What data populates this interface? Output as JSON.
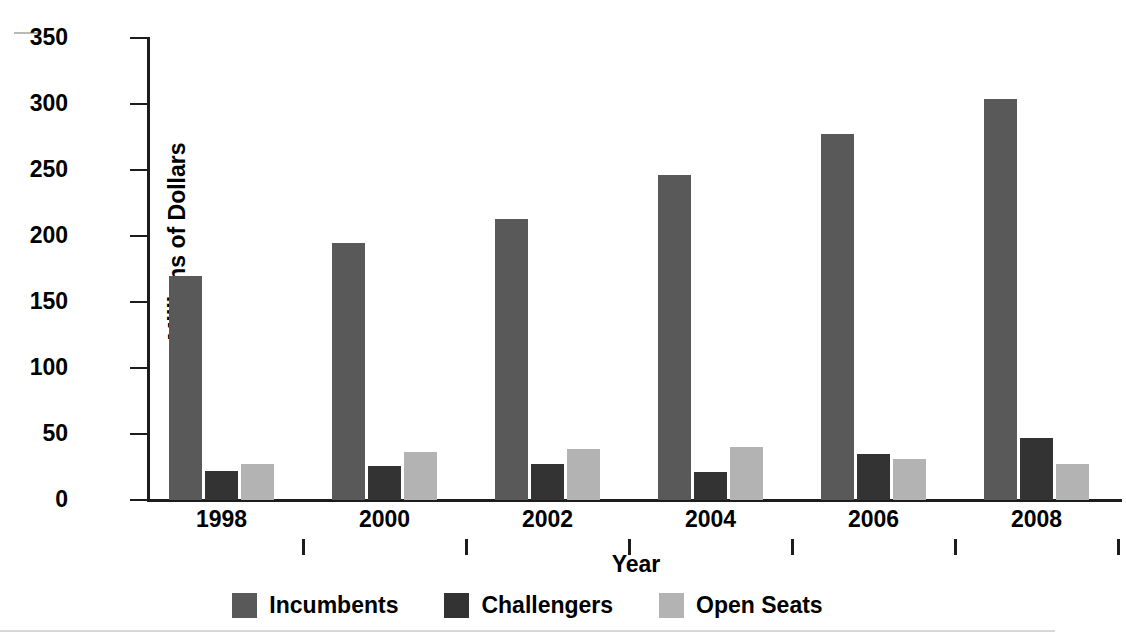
{
  "figure": {
    "background": "#ffffff",
    "axis_color": "#1c1c1c"
  },
  "chart_data": {
    "type": "bar",
    "title": "",
    "xlabel": "Year",
    "ylabel": "Millions of Dollars",
    "categories": [
      "1998",
      "2000",
      "2002",
      "2004",
      "2006",
      "2008"
    ],
    "ylim": [
      0,
      350
    ],
    "yticks": [
      0,
      50,
      100,
      150,
      200,
      250,
      300,
      350
    ],
    "ytick_labels": [
      "0",
      "50",
      "100",
      "150",
      "200",
      "250",
      "300",
      "350"
    ],
    "grid": false,
    "legend_position": "bottom",
    "series": [
      {
        "name": "Incumbents",
        "color": "#595959",
        "values": [
          170,
          195,
          213,
          246,
          277,
          304
        ]
      },
      {
        "name": "Challengers",
        "color": "#333333",
        "values": [
          22,
          26,
          27,
          21,
          35,
          47
        ]
      },
      {
        "name": "Open Seats",
        "color": "#b3b3b3",
        "values": [
          27,
          36,
          39,
          40,
          31,
          27
        ]
      }
    ]
  },
  "axes": {
    "y_title": "Millions of Dollars",
    "x_title": "Year"
  },
  "legend": {
    "items": [
      {
        "label": "Incumbents",
        "color": "#595959"
      },
      {
        "label": "Challengers",
        "color": "#333333"
      },
      {
        "label": "Open Seats",
        "color": "#b3b3b3"
      }
    ]
  }
}
